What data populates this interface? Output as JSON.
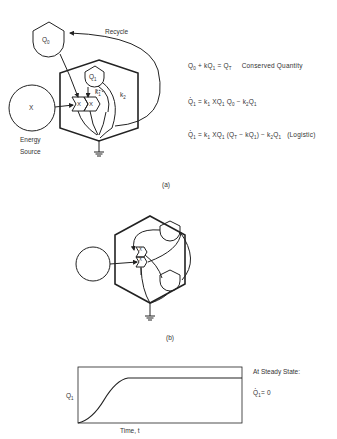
{
  "panel_a": {
    "label": "(a)",
    "q0_label": "Q0",
    "q1_label": "Q1",
    "x_label": "X",
    "energy_source_label": "Energy Source",
    "energy_line1": "Energy",
    "energy_line2": "Source",
    "recycle_label": "Recycle",
    "k1_label": "k1",
    "k2_label": "k2",
    "workgate_label": "X"
  },
  "equations": {
    "conserved": "Q0 + kQ1 = QT",
    "conserved_caption": "Conserved Quantity",
    "eq2": "Q̇1 = k1 X Q1 Q0 − k2 Q1",
    "eq3": "Q̇1 = k1 X Q1 (QT − kQ1) − k2 Q1",
    "eq3_caption": "(Logistic)"
  },
  "panel_b": {
    "label": "(b)",
    "workgate_label": "X"
  },
  "graph": {
    "ylabel": "Q1",
    "xlabel": "Time, t",
    "steady_state_caption": "At Steady State:",
    "steady_state_eq": "Q̇1 = 0"
  },
  "colors": {
    "ink": "#222222",
    "background": "#ffffff"
  }
}
